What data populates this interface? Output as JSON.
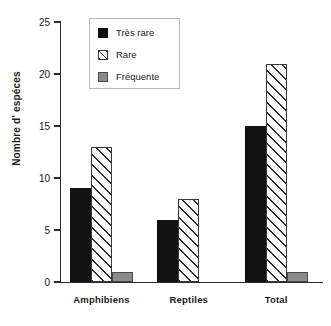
{
  "chart_data": {
    "type": "bar",
    "title": "",
    "xlabel": "",
    "ylabel": "Nombre d' espéces",
    "categories": [
      "Amphibiens",
      "Reptiles",
      "Total"
    ],
    "series": [
      {
        "name": "Très rare",
        "values": [
          9,
          6,
          15
        ],
        "color": "#111111",
        "fill": "solid"
      },
      {
        "name": "Rare",
        "values": [
          13,
          8,
          21
        ],
        "color": "#ffffff",
        "fill": "diagonal-hatch"
      },
      {
        "name": "Fréquente",
        "values": [
          1,
          0,
          1
        ],
        "color": "#8a8a8a",
        "fill": "solid"
      }
    ],
    "ylim": [
      0,
      25
    ],
    "yticks": [
      0,
      5,
      10,
      15,
      20,
      25
    ],
    "ytick_labels": [
      "0",
      "5",
      "10",
      "15",
      "20",
      "25"
    ],
    "grid": false,
    "legend_position": "top-center",
    "legend_entries": [
      "Très rare",
      "Rare",
      "Fréquente"
    ]
  }
}
